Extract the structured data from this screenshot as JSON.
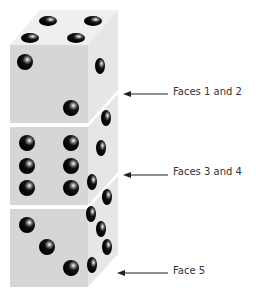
{
  "labels": [
    {
      "text": "Faces 1 and 2",
      "x": 173,
      "y": 85
    },
    {
      "text": "Faces 3 and 4",
      "x": 173,
      "y": 165
    },
    {
      "text": "Face 5",
      "x": 173,
      "y": 264
    }
  ],
  "colors": {
    "front_face": "#d4d4d4",
    "side_face": "#e6e6e6",
    "top_face": "#efefef",
    "pip": "#111111",
    "arrow": "#222222"
  }
}
